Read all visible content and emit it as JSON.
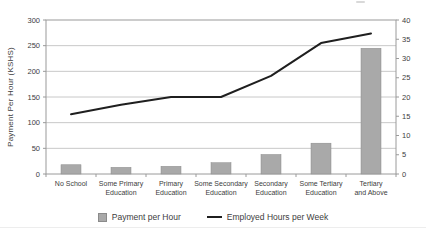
{
  "figure": {
    "kind": "combo chart: bars + line, grayscale",
    "background": "#ffffff"
  },
  "y_axis_title": "Payment Per Hour (KSHS)",
  "legend": {
    "payment_label": "Payment per Hour",
    "hours_label": "Employed Hours per Week"
  },
  "chart_data": {
    "type": "bar+line combo",
    "title": "",
    "categories": [
      [
        "No School"
      ],
      [
        "Some Primary",
        "Education"
      ],
      [
        "Primary",
        "Education"
      ],
      [
        "Some Secondary",
        "Education"
      ],
      [
        "Secondary",
        "Education"
      ],
      [
        "Some Tertiary",
        "Education"
      ],
      [
        "Tertiary",
        "and Above"
      ]
    ],
    "series": [
      {
        "name": "Payment per Hour",
        "type": "bar",
        "axis": "left",
        "values": [
          18,
          13,
          15,
          22,
          38,
          60,
          245
        ],
        "color": "#a9a9a9"
      },
      {
        "name": "Employed Hours per Week",
        "type": "line",
        "axis": "right",
        "values": [
          15.5,
          18,
          20,
          20,
          25.5,
          34,
          36.5
        ],
        "color": "#1f1f1f"
      }
    ],
    "left_axis": {
      "title": "Payment Per Hour (KSHS)",
      "min": 0,
      "max": 300,
      "tick_step": 50,
      "ticks": [
        0,
        50,
        100,
        150,
        200,
        250,
        300
      ]
    },
    "right_axis": {
      "title": "",
      "min": 0,
      "max": 40,
      "tick_step": 5,
      "ticks": [
        0,
        5,
        10,
        15,
        20,
        25,
        30,
        35,
        40
      ]
    },
    "grid": "horizontal gridlines every 50 KSHS, plot frame box",
    "legend_position": "bottom"
  },
  "colors": {
    "bar_fill": "#a9a9a9",
    "bar_border": "#8b8b8b",
    "line_stroke": "#1f1f1f",
    "gridline": "#c8c8c8",
    "axis_frame": "#9a9a9a",
    "text": "#3d3d3d"
  }
}
